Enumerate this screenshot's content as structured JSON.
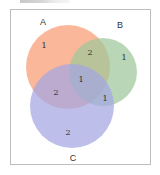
{
  "diagram": {
    "type": "venn3",
    "sets": [
      {
        "id": "A",
        "label": "A",
        "color": "#f8a37e",
        "cx": 68,
        "cy": 67,
        "r": 42,
        "label_x": 43,
        "label_y": 25
      },
      {
        "id": "B",
        "label": "B",
        "color": "#9ec79a",
        "cx": 103,
        "cy": 72,
        "r": 34,
        "label_x": 120,
        "label_y": 28
      },
      {
        "id": "C",
        "label": "C",
        "color": "#a4a6e2",
        "cx": 72,
        "cy": 106,
        "r": 42,
        "label_x": 73,
        "label_y": 161
      }
    ],
    "regions": [
      {
        "id": "A_only",
        "value": "1",
        "x": 44,
        "y": 48
      },
      {
        "id": "AB_only",
        "value": "2",
        "x": 90,
        "y": 55
      },
      {
        "id": "B_only",
        "value": "1",
        "x": 124,
        "y": 60
      },
      {
        "id": "ABC",
        "value": "1",
        "x": 81,
        "y": 82
      },
      {
        "id": "AC_only",
        "value": "2",
        "x": 56,
        "y": 95
      },
      {
        "id": "BC_only",
        "value": "1",
        "x": 105,
        "y": 101
      },
      {
        "id": "C_only",
        "value": "2",
        "x": 68,
        "y": 135
      }
    ]
  },
  "chart_data": {
    "type": "venn",
    "sets": [
      "A",
      "B",
      "C"
    ],
    "regions": {
      "A": 1,
      "B": 1,
      "C": 2,
      "A&B": 2,
      "A&C": 2,
      "B&C": 1,
      "A&B&C": 1
    },
    "colors": {
      "A": "#f8a37e",
      "B": "#9ec79a",
      "C": "#a4a6e2"
    }
  }
}
